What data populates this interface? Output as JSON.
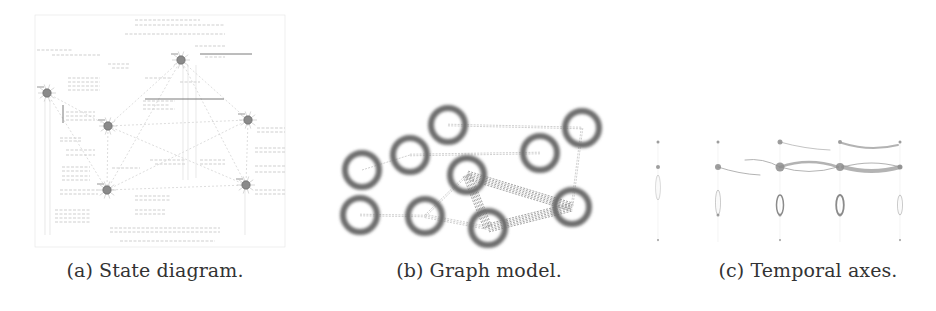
{
  "figure": {
    "subfigures": [
      {
        "id": "a",
        "caption": "(a) State diagram.",
        "caption_x": 155,
        "kind": "state-diagram",
        "bbox": [
          35,
          15,
          250,
          232
        ],
        "nodes": [
          {
            "x": 47,
            "y": 93
          },
          {
            "x": 181,
            "y": 60
          },
          {
            "x": 108,
            "y": 126
          },
          {
            "x": 107,
            "y": 190
          },
          {
            "x": 248,
            "y": 120
          },
          {
            "x": 246,
            "y": 185
          }
        ],
        "edges": [
          [
            0,
            2
          ],
          [
            2,
            1
          ],
          [
            1,
            4
          ],
          [
            4,
            5
          ],
          [
            5,
            3
          ],
          [
            3,
            2
          ],
          [
            2,
            4
          ],
          [
            3,
            1
          ],
          [
            5,
            1
          ],
          [
            0,
            3
          ],
          [
            2,
            5
          ],
          [
            3,
            4
          ]
        ],
        "label_lines": [
          [
            135,
            20,
            200
          ],
          [
            135,
            25,
            225
          ],
          [
            125,
            34,
            225
          ],
          [
            37,
            50,
            72
          ],
          [
            52,
            55,
            100
          ],
          [
            195,
            46,
            225
          ],
          [
            205,
            57,
            225
          ],
          [
            108,
            64,
            130
          ],
          [
            112,
            68,
            130
          ],
          [
            68,
            78,
            100
          ],
          [
            68,
            82,
            100
          ],
          [
            68,
            86,
            100
          ],
          [
            68,
            90,
            100
          ],
          [
            145,
            78,
            170
          ],
          [
            66,
            112,
            95
          ],
          [
            66,
            116,
            95
          ],
          [
            66,
            120,
            95
          ],
          [
            143,
            101,
            175
          ],
          [
            143,
            105,
            170
          ],
          [
            143,
            109,
            175
          ],
          [
            180,
            82,
            200
          ],
          [
            60,
            138,
            82
          ],
          [
            60,
            141,
            82
          ],
          [
            66,
            150,
            95
          ],
          [
            66,
            155,
            95
          ],
          [
            150,
            160,
            185
          ],
          [
            155,
            164,
            185
          ],
          [
            112,
            168,
            140
          ],
          [
            62,
            167,
            90
          ],
          [
            62,
            171,
            90
          ],
          [
            62,
            176,
            90
          ],
          [
            62,
            180,
            90
          ],
          [
            200,
            160,
            225
          ],
          [
            200,
            164,
            225
          ],
          [
            60,
            190,
            98
          ],
          [
            60,
            194,
            98
          ],
          [
            55,
            210,
            90
          ],
          [
            55,
            214,
            90
          ],
          [
            55,
            218,
            90
          ],
          [
            55,
            222,
            90
          ],
          [
            135,
            196,
            170
          ],
          [
            135,
            200,
            170
          ],
          [
            135,
            210,
            165
          ],
          [
            135,
            214,
            165
          ],
          [
            110,
            228,
            220
          ],
          [
            110,
            232,
            220
          ],
          [
            120,
            241,
            215
          ],
          [
            257,
            128,
            285
          ],
          [
            257,
            132,
            285
          ],
          [
            255,
            148,
            285
          ],
          [
            255,
            152,
            285
          ],
          [
            255,
            166,
            285
          ],
          [
            255,
            172,
            285
          ],
          [
            255,
            190,
            285
          ],
          [
            255,
            194,
            285
          ]
        ],
        "bold_lines": [
          [
            200,
            54,
            252
          ],
          [
            145,
            99,
            224
          ],
          [
            63,
            105,
            63,
            123
          ]
        ]
      },
      {
        "id": "b",
        "caption": "(b) Graph model.",
        "caption_x": 479,
        "kind": "graph-model",
        "nodes": [
          {
            "x": 362,
            "y": 170
          },
          {
            "x": 410,
            "y": 155
          },
          {
            "x": 448,
            "y": 125
          },
          {
            "x": 467,
            "y": 175
          },
          {
            "x": 540,
            "y": 153
          },
          {
            "x": 582,
            "y": 128
          },
          {
            "x": 360,
            "y": 215
          },
          {
            "x": 425,
            "y": 216
          },
          {
            "x": 488,
            "y": 228
          },
          {
            "x": 572,
            "y": 207
          }
        ],
        "node_radius": 17,
        "edges": [
          {
            "from": 2,
            "to": 5,
            "weight": 1
          },
          {
            "from": 1,
            "to": 4,
            "weight": 1
          },
          {
            "from": 0,
            "to": 1,
            "weight": 0.5
          },
          {
            "from": 5,
            "to": 9,
            "weight": 1
          },
          {
            "from": 6,
            "to": 7,
            "weight": 1
          },
          {
            "from": 7,
            "to": 8,
            "weight": 1.5
          },
          {
            "from": 7,
            "to": 3,
            "weight": 1
          },
          {
            "from": 3,
            "to": 9,
            "weight": 3
          },
          {
            "from": 3,
            "to": 8,
            "weight": 3
          },
          {
            "from": 8,
            "to": 9,
            "weight": 3
          }
        ]
      },
      {
        "id": "c",
        "caption": "(c) Temporal axes.",
        "caption_x": 808,
        "kind": "temporal-axes",
        "columns": [
          658,
          718,
          780,
          840,
          900
        ],
        "rows": [
          142,
          167,
          215,
          240
        ],
        "points": [
          {
            "c": 0,
            "r": 0,
            "s": 1.5
          },
          {
            "c": 0,
            "r": 1,
            "s": 2
          },
          {
            "c": 0,
            "r": 3,
            "s": 1
          },
          {
            "c": 1,
            "r": 0,
            "s": 1.5
          },
          {
            "c": 1,
            "r": 1,
            "s": 3
          },
          {
            "c": 1,
            "r": 2,
            "s": 1.5
          },
          {
            "c": 2,
            "r": 0,
            "s": 2.5
          },
          {
            "c": 2,
            "r": 1,
            "s": 4.5
          },
          {
            "c": 2,
            "r": 2,
            "s": 1.5
          },
          {
            "c": 2,
            "r": 3,
            "s": 1
          },
          {
            "c": 3,
            "r": 0,
            "s": 2
          },
          {
            "c": 3,
            "r": 1,
            "s": 4
          },
          {
            "c": 3,
            "r": 2,
            "s": 1.5
          },
          {
            "c": 4,
            "r": 0,
            "s": 1.5
          },
          {
            "c": 4,
            "r": 1,
            "s": 2.5
          },
          {
            "c": 4,
            "r": 3,
            "s": 1
          }
        ],
        "arcs": [
          {
            "x1": 745,
            "y1": 160,
            "x2": 780,
            "y2": 167,
            "w": 1,
            "bend": -6
          },
          {
            "x1": 780,
            "y1": 167,
            "x2": 838,
            "y2": 167,
            "w": 2.5,
            "bend": -10
          },
          {
            "x1": 780,
            "y1": 167,
            "x2": 838,
            "y2": 167,
            "w": 1,
            "bend": 9
          },
          {
            "x1": 718,
            "y1": 167,
            "x2": 760,
            "y2": 175,
            "w": 1,
            "bend": 3
          },
          {
            "x1": 843,
            "y1": 167,
            "x2": 900,
            "y2": 167,
            "w": 4,
            "bend": 8
          },
          {
            "x1": 843,
            "y1": 167,
            "x2": 900,
            "y2": 167,
            "w": 1.2,
            "bend": -8
          },
          {
            "x1": 842,
            "y1": 143,
            "x2": 898,
            "y2": 145,
            "w": 2,
            "bend": 8
          },
          {
            "x1": 780,
            "y1": 142,
            "x2": 830,
            "y2": 150,
            "w": 0.8,
            "bend": 3
          }
        ],
        "loops": [
          {
            "c": 2,
            "y1": 195,
            "y2": 215,
            "w": 2.5
          },
          {
            "c": 3,
            "y1": 195,
            "y2": 215,
            "w": 3
          },
          {
            "c": 1,
            "y1": 190,
            "y2": 215,
            "w": 0.8
          },
          {
            "c": 4,
            "y1": 195,
            "y2": 215,
            "w": 0.8
          },
          {
            "c": 0,
            "y1": 175,
            "y2": 200,
            "w": 0.6
          }
        ]
      }
    ]
  }
}
